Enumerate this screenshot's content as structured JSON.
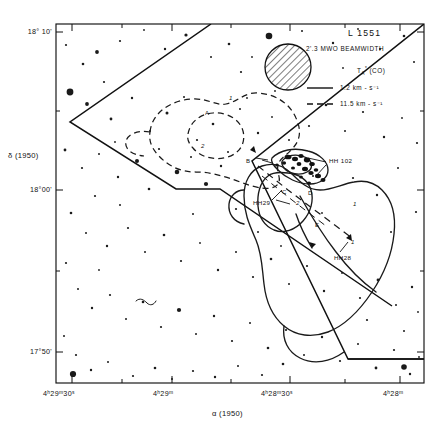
{
  "figure": {
    "source_label": "L 1551",
    "beam_label": "2'.3 MWO BEAMWIDTH",
    "quantity_label": "T",
    "quantity_sub": "A",
    "quantity_sup": "*",
    "quantity_paren": "(CO)",
    "legend_entries": [
      {
        "style": "solid",
        "label": "1.2 km - s⁻¹"
      },
      {
        "style": "dashed",
        "label": "11.5 km - s⁻¹"
      }
    ]
  },
  "axes": {
    "x_label": "α (1950)",
    "y_label": "δ (1950)",
    "x_ticks": [
      {
        "value": "4ʰ29ᵐ30ˢ",
        "x": 72
      },
      {
        "value": "4ʰ29ᵐ",
        "x": 172
      },
      {
        "value": "4ʰ28ᵐ30ˢ",
        "x": 290
      },
      {
        "value": "4ʰ28ᵐ",
        "x": 400
      }
    ],
    "y_ticks": [
      {
        "value": "18° 10'",
        "y": 32
      },
      {
        "value": "18°00'",
        "y": 190
      },
      {
        "value": "17°50'",
        "y": 352
      }
    ],
    "plot_box": {
      "left": 56,
      "top": 24,
      "right": 424,
      "bottom": 383
    }
  },
  "annotations": {
    "contour_levels": [
      {
        "label": "1",
        "x": 229,
        "y": 99,
        "italic": true
      },
      {
        "label": "A",
        "x": 207,
        "y": 114,
        "italic": false
      },
      {
        "label": "2",
        "x": 202,
        "y": 146,
        "italic": true
      },
      {
        "label": "B",
        "x": 248,
        "y": 162,
        "italic": false
      },
      {
        "label": "C",
        "x": 283,
        "y": 193,
        "italic": false
      },
      {
        "label": "D",
        "x": 309,
        "y": 194,
        "italic": false
      },
      {
        "label": "2",
        "x": 297,
        "y": 204,
        "italic": true
      },
      {
        "label": "E",
        "x": 316,
        "y": 226,
        "italic": false
      },
      {
        "label": "1",
        "x": 354,
        "y": 205,
        "italic": true
      },
      {
        "label": "1",
        "x": 352,
        "y": 243,
        "italic": true
      }
    ],
    "objects": [
      {
        "name": "HH 102",
        "x": 329,
        "y": 161
      },
      {
        "name": "HH29",
        "x": 259,
        "y": 202
      },
      {
        "name": "HH28",
        "x": 343,
        "y": 257
      }
    ]
  },
  "colors": {
    "ink": "#111111",
    "background": "#ffffff",
    "contour": "#1a1a1a"
  }
}
